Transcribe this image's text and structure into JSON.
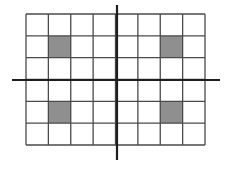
{
  "diagram": {
    "title": "",
    "grid": {
      "columns": 8,
      "rows": 6,
      "left": 26,
      "top": 14,
      "right": 205,
      "bottom": 145,
      "line_color": "#4a4a4a",
      "line_width": 1.3,
      "background": "#ffffff"
    },
    "shaded_cells": [
      {
        "row": 1,
        "col": 1
      },
      {
        "row": 1,
        "col": 6
      },
      {
        "row": 4,
        "col": 1
      },
      {
        "row": 4,
        "col": 6
      }
    ],
    "shade_color": "#8f8f8f",
    "axes": {
      "color": "#1e1e1e",
      "width": 2.2,
      "x_axis": {
        "y": 80,
        "x_start": 12,
        "x_end": 220
      },
      "y_axis": {
        "x": 117,
        "y_start": 5,
        "y_end": 160
      }
    }
  }
}
